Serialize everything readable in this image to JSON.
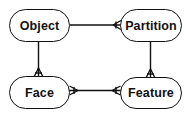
{
  "diagram": {
    "type": "entity-relationship",
    "notation": "crows-foot",
    "colors": {
      "stroke": "#111111",
      "fill": "#ffffff",
      "text": "#111111"
    },
    "nodes": [
      {
        "id": "object",
        "label": "Object"
      },
      {
        "id": "partition",
        "label": "Partition"
      },
      {
        "id": "face",
        "label": "Face"
      },
      {
        "id": "feature",
        "label": "Feature"
      }
    ],
    "edges": [
      {
        "from": "object",
        "to": "partition",
        "from_card": "one",
        "to_card": "many"
      },
      {
        "from": "object",
        "to": "face",
        "from_card": "one",
        "to_card": "many"
      },
      {
        "from": "partition",
        "to": "feature",
        "from_card": "one",
        "to_card": "many"
      },
      {
        "from": "face",
        "to": "feature",
        "from_card": "many",
        "to_card": "many"
      }
    ]
  }
}
